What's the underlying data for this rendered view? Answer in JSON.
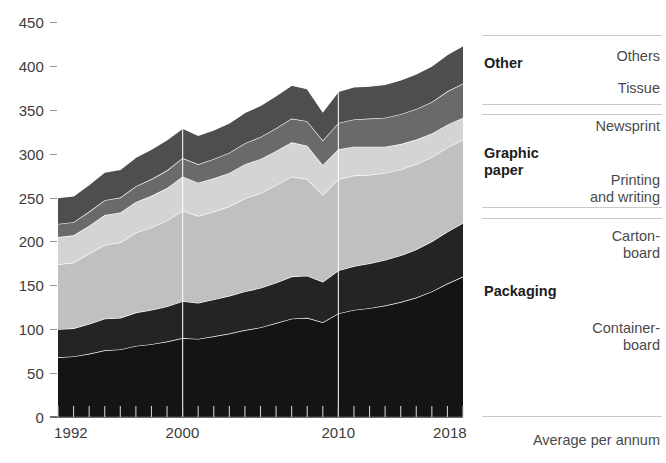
{
  "chart_data": {
    "type": "area",
    "title": "",
    "subtitle": "",
    "xlabel": "",
    "ylabel": "",
    "stacked": true,
    "grid": false,
    "legend_position": "right",
    "xlim": [
      1992,
      2018
    ],
    "ylim": [
      0,
      450
    ],
    "y_ticks": [
      0,
      50,
      100,
      150,
      200,
      250,
      300,
      350,
      400,
      450
    ],
    "x_ticks_labeled": [
      1992,
      2000,
      2010,
      2018
    ],
    "x": [
      1992,
      1993,
      1994,
      1995,
      1996,
      1997,
      1998,
      1999,
      2000,
      2001,
      2002,
      2003,
      2004,
      2005,
      2006,
      2007,
      2008,
      2009,
      2010,
      2011,
      2012,
      2013,
      2014,
      2015,
      2016,
      2017,
      2018
    ],
    "series": [
      {
        "name": "Containerboard",
        "group": "Packaging",
        "color": "#141414",
        "values": [
          68,
          69,
          72,
          76,
          77,
          81,
          83,
          86,
          90,
          89,
          92,
          95,
          99,
          102,
          107,
          112,
          113,
          108,
          118,
          122,
          124,
          127,
          131,
          136,
          143,
          152,
          160
        ]
      },
      {
        "name": "Cartonboard",
        "group": "Packaging",
        "color": "#242424",
        "values": [
          32,
          32,
          34,
          36,
          36,
          38,
          39,
          40,
          42,
          41,
          42,
          43,
          44,
          45,
          46,
          48,
          48,
          46,
          49,
          50,
          51,
          52,
          53,
          55,
          57,
          59,
          61
        ]
      },
      {
        "name": "Printing and writing",
        "group": "Graphic paper",
        "color": "#c0c0c0",
        "values": [
          74,
          75,
          80,
          84,
          86,
          91,
          94,
          98,
          103,
          99,
          100,
          102,
          106,
          108,
          111,
          114,
          110,
          99,
          104,
          103,
          101,
          99,
          98,
          97,
          96,
          96,
          95
        ]
      },
      {
        "name": "Newsprint",
        "group": "Graphic paper",
        "color": "#d4d4d4",
        "values": [
          31,
          31,
          32,
          34,
          34,
          35,
          36,
          37,
          39,
          38,
          38,
          38,
          39,
          39,
          39,
          39,
          38,
          34,
          34,
          33,
          32,
          30,
          29,
          28,
          27,
          26,
          25
        ]
      },
      {
        "name": "Tissue",
        "group": "Other",
        "color": "#6a6a6a",
        "values": [
          15,
          15,
          16,
          17,
          17,
          18,
          19,
          20,
          21,
          21,
          22,
          23,
          24,
          25,
          26,
          27,
          28,
          28,
          30,
          31,
          32,
          33,
          34,
          35,
          36,
          38,
          39
        ]
      },
      {
        "name": "Others",
        "group": "Other",
        "color": "#4e4e4e",
        "values": [
          30,
          30,
          31,
          32,
          32,
          33,
          34,
          35,
          34,
          33,
          33,
          34,
          35,
          36,
          37,
          38,
          37,
          33,
          36,
          37,
          37,
          38,
          39,
          40,
          41,
          42,
          43
        ]
      }
    ],
    "totals": [
      250,
      252,
      265,
      279,
      282,
      296,
      305,
      316,
      329,
      321,
      327,
      335,
      347,
      355,
      366,
      378,
      374,
      348,
      371,
      376,
      377,
      379,
      384,
      391,
      400,
      413,
      423
    ]
  },
  "axis": {
    "y_labels": [
      "450",
      "400",
      "350",
      "300",
      "250",
      "200",
      "150",
      "100",
      "50",
      "0"
    ],
    "x_labels": [
      "1992",
      "2000",
      "2010",
      "2018"
    ]
  },
  "legend": {
    "groups": [
      {
        "name": "Other",
        "items": [
          "Others",
          "Tissue"
        ]
      },
      {
        "name": "Graphic\npaper",
        "items": [
          "Newsprint",
          "Printing\nand writing"
        ]
      },
      {
        "name": "Packaging",
        "items": [
          "Carton-\nboard",
          "Container-\nboard"
        ]
      }
    ],
    "footer": "Average per annum"
  }
}
